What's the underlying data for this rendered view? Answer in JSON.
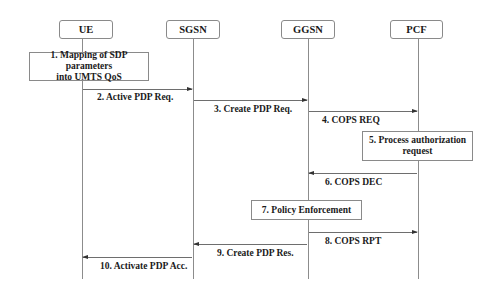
{
  "diagram": {
    "type": "sequence",
    "actors": [
      {
        "id": "ue",
        "label": "UE"
      },
      {
        "id": "sgsn",
        "label": "SGSN"
      },
      {
        "id": "ggsn",
        "label": "GGSN"
      },
      {
        "id": "pcf",
        "label": "PCF"
      }
    ],
    "steps": [
      {
        "n": 1,
        "kind": "process",
        "actor": "ue",
        "line1": "1. Mapping of SDP parameters",
        "line2": "into UMTS QoS"
      },
      {
        "n": 2,
        "kind": "message",
        "from": "ue",
        "to": "sgsn",
        "label": "2. Active PDP Req."
      },
      {
        "n": 3,
        "kind": "message",
        "from": "sgsn",
        "to": "ggsn",
        "label": "3. Create PDP Req."
      },
      {
        "n": 4,
        "kind": "message",
        "from": "ggsn",
        "to": "pcf",
        "label": "4. COPS REQ"
      },
      {
        "n": 5,
        "kind": "process",
        "actor": "pcf",
        "line1": "5. Process authorization",
        "line2": "request"
      },
      {
        "n": 6,
        "kind": "message",
        "from": "pcf",
        "to": "ggsn",
        "label": "6. COPS DEC"
      },
      {
        "n": 7,
        "kind": "process",
        "actor": "ggsn",
        "line1": "7. Policy Enforcement"
      },
      {
        "n": 8,
        "kind": "message",
        "from": "ggsn",
        "to": "pcf",
        "label": "8. COPS RPT"
      },
      {
        "n": 9,
        "kind": "message",
        "from": "ggsn",
        "to": "sgsn",
        "label": "9. Create PDP Res."
      },
      {
        "n": 10,
        "kind": "message",
        "from": "sgsn",
        "to": "ue",
        "label": "10. Activate PDP Acc."
      }
    ]
  }
}
